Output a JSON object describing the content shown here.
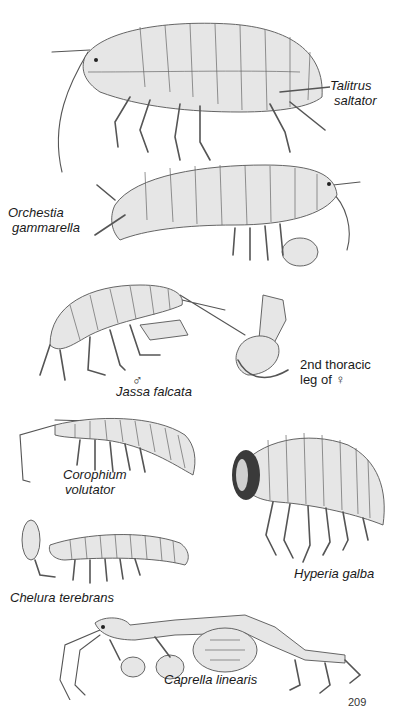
{
  "page": {
    "page_number": "209",
    "background": "#ffffff",
    "text_color": "#1a1a1a"
  },
  "specimens": [
    {
      "id": "talitrus",
      "label_line1": "Talitrus",
      "label_line2": "saltator",
      "icon": "amphipod-illustration"
    },
    {
      "id": "orchestia",
      "label_line1": "Orchestia",
      "label_line2": "gammarella",
      "icon": "amphipod-illustration"
    },
    {
      "id": "jassa",
      "label": "Jassa falcata",
      "sex_symbol": "♂",
      "icon": "amphipod-illustration"
    },
    {
      "id": "thoracic-leg",
      "label_line1": "2nd thoracic",
      "label_line2": "leg of ♀",
      "icon": "leg-illustration"
    },
    {
      "id": "corophium",
      "label_line1": "Corophium",
      "label_line2": "volutator",
      "icon": "amphipod-illustration"
    },
    {
      "id": "hyperia",
      "label": "Hyperia galba",
      "icon": "amphipod-illustration"
    },
    {
      "id": "chelura",
      "label": "Chelura terebrans",
      "icon": "amphipod-illustration"
    },
    {
      "id": "caprella",
      "label": "Caprella linearis",
      "icon": "skeleton-shrimp-illustration"
    }
  ]
}
